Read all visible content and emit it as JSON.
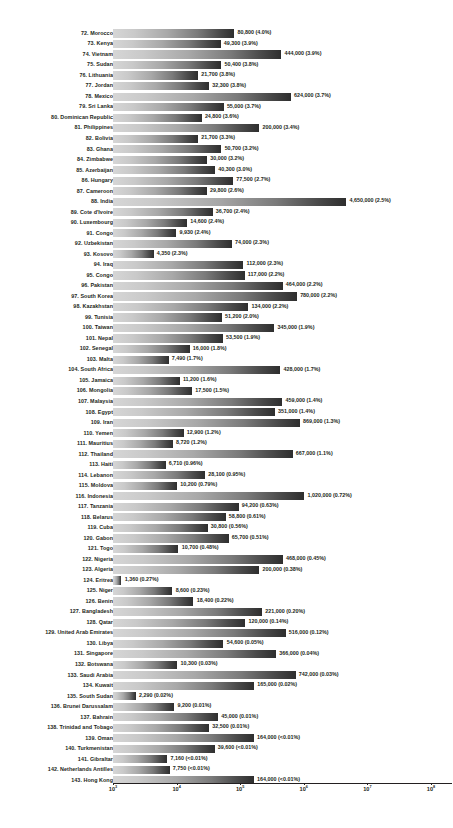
{
  "chart_data": {
    "type": "bar",
    "orientation": "horizontal",
    "title": "",
    "subtitle": "",
    "xlabel": "",
    "ylabel": "",
    "xscale": "log",
    "xlim": [
      1000,
      100000000
    ],
    "grid": false,
    "legend": null,
    "axis_ticks": [
      {
        "value": 1000,
        "label": "10",
        "exponent": "3"
      },
      {
        "value": 10000,
        "label": "10",
        "exponent": "4"
      },
      {
        "value": 100000,
        "label": "10",
        "exponent": "5"
      },
      {
        "value": 1000000,
        "label": "10",
        "exponent": "6"
      },
      {
        "value": 10000000,
        "label": "10",
        "exponent": "7"
      },
      {
        "value": 100000000,
        "label": "10",
        "exponent": "8"
      }
    ],
    "categories": [
      "72. Morocco",
      "73. Kenya",
      "74. Vietnam",
      "75. Sudan",
      "76. Lithuania",
      "77. Jordan",
      "78. Mexico",
      "79. Sri Lanka",
      "80. Dominican Republic",
      "81. Philippines",
      "82. Bolivia",
      "83. Ghana",
      "84. Zimbabwe",
      "85. Azerbaijan",
      "86. Hungary",
      "87. Cameroon",
      "88. India",
      "89. Cote d'Ivoire",
      "90. Luxembourg",
      "91. Congo",
      "92. Uzbekistan",
      "93. Kosovo",
      "94. Iraq",
      "95. Congo",
      "96. Pakistan",
      "97. South Korea",
      "98. Kazakhstan",
      "99. Tunisia",
      "100. Taiwan",
      "101. Nepal",
      "102. Senegal",
      "103. Malta",
      "104. South Africa",
      "105. Jamaica",
      "106. Mongolia",
      "107. Malaysia",
      "108. Egypt",
      "109. Iran",
      "110. Yemen",
      "111. Mauritius",
      "112. Thailand",
      "113. Haiti",
      "114. Lebanon",
      "115. Moldova",
      "116. Indonesia",
      "117. Tanzania",
      "118. Belarus",
      "119. Cuba",
      "120. Gabon",
      "121. Togo",
      "122. Nigeria",
      "123. Algeria",
      "124. Eritrea",
      "125. Niger",
      "126. Benin",
      "127. Bangladesh",
      "128. Qatar",
      "129. United Arab Emirates",
      "130. Libya",
      "131. Singapore",
      "132. Botswana",
      "133. Saudi Arabia",
      "134. Kuwait",
      "135. South Sudan",
      "136. Brunei Darussalam",
      "137. Bahrain",
      "138. Trinidad and Tobago",
      "139. Oman",
      "140. Turkmenistan",
      "141. Gibraltar",
      "142. Netherlands Antilles",
      "143. Hong Kong"
    ],
    "values": [
      80800,
      49300,
      444000,
      50400,
      21700,
      32300,
      624000,
      55000,
      24800,
      200000,
      21700,
      50700,
      30000,
      40300,
      77500,
      29800,
      4650000,
      36700,
      14600,
      9930,
      74000,
      4350,
      112000,
      117000,
      464000,
      780000,
      134000,
      51200,
      345000,
      53500,
      16000,
      7490,
      428000,
      11200,
      17500,
      459000,
      351000,
      869000,
      12900,
      8720,
      667000,
      6710,
      28100,
      10200,
      1020000,
      94200,
      58800,
      30800,
      65700,
      10700,
      468000,
      200000,
      1360,
      8600,
      18400,
      221000,
      120000,
      516000,
      54600,
      366000,
      10300,
      742000,
      165000,
      2290,
      9200,
      45000,
      32500,
      164000,
      39600,
      7160,
      7750,
      164000
    ],
    "value_labels": [
      "80,800 (4.0%)",
      "49,300 (3.9%)",
      "444,000 (3.9%)",
      "50,400 (3.8%)",
      "21,700 (3.8%)",
      "32,300 (3.8%)",
      "624,000 (3.7%)",
      "55,000 (3.7%)",
      "24,800 (3.6%)",
      "200,000 (3.4%)",
      "21,700 (3.3%)",
      "50,700 (3.2%)",
      "30,000 (3.2%)",
      "40,300 (3.0%)",
      "77,500 (2.7%)",
      "29,800 (2.6%)",
      "4,650,000 (2.5%)",
      "36,700 (2.4%)",
      "14,600 (2.4%)",
      "9,930 (2.4%)",
      "74,000 (2.3%)",
      "4,350 (2.3%)",
      "112,000 (2.3%)",
      "117,000 (2.2%)",
      "464,000 (2.2%)",
      "780,000 (2.2%)",
      "134,000 (2.2%)",
      "51,200 (2.0%)",
      "345,000 (1.9%)",
      "53,500 (1.9%)",
      "16,000 (1.8%)",
      "7,490 (1.7%)",
      "428,000 (1.7%)",
      "11,200 (1.6%)",
      "17,500 (1.5%)",
      "459,000 (1.4%)",
      "351,000 (1.4%)",
      "869,000 (1.3%)",
      "12,900 (1.2%)",
      "8,720 (1.2%)",
      "667,000 (1.1%)",
      "6,710 (0.96%)",
      "28,100 (0.95%)",
      "10,200 (0.79%)",
      "1,020,000 (0.72%)",
      "94,200 (0.63%)",
      "58,800 (0.61%)",
      "30,800 (0.56%)",
      "65,700 (0.51%)",
      "10,700 (0.48%)",
      "468,000 (0.45%)",
      "200,000 (0.38%)",
      "1,360 (0.27%)",
      "8,600 (0.23%)",
      "18,400 (0.22%)",
      "221,000 (0.20%)",
      "120,000 (0.14%)",
      "516,000 (0.12%)",
      "54,600 (0.05%)",
      "366,000 (0.04%)",
      "10,300 (0.03%)",
      "742,000 (0.03%)",
      "165,000 (0.02%)",
      "2,290 (0.02%)",
      "9,200 (0.01%)",
      "45,000 (0.01%)",
      "32,500 (0.01%)",
      "164,000 (<0.01%)",
      "39,600 (<0.01%)",
      "7,160 (<0.01%)",
      "7,750 (<0.01%)",
      "164,000 (<0.01%)"
    ]
  },
  "style": {
    "bar_gradient_start": "#d6d6d6",
    "bar_gradient_end": "#2e2e2e",
    "text_color": "#231f20",
    "background": "#ffffff"
  }
}
